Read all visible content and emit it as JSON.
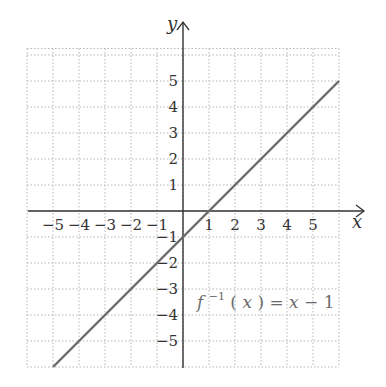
{
  "chart_data": {
    "type": "line",
    "title": "",
    "xlabel": "x",
    "ylabel": "y",
    "xlim": [
      -6,
      6
    ],
    "ylim": [
      -6,
      6.25
    ],
    "grid": true,
    "grid_style": "dotted",
    "x_ticks": [
      -5,
      -4,
      -3,
      -2,
      -1,
      1,
      2,
      3,
      4,
      5
    ],
    "y_ticks": [
      -5,
      -4,
      -3,
      -2,
      -1,
      1,
      2,
      3,
      4,
      5
    ],
    "x_tick_labels": [
      "−5",
      "−4",
      "−3",
      "−2",
      "−1",
      "1",
      "2",
      "3",
      "4",
      "5"
    ],
    "y_tick_labels": [
      "−5",
      "−4",
      "−3",
      "−2",
      "−1",
      "1",
      "2",
      "3",
      "4",
      "5"
    ],
    "series": [
      {
        "name": "f^-1(x) = x - 1",
        "equation": "y = x - 1",
        "color": "#6b6b6b",
        "x": [
          -5,
          6
        ],
        "y": [
          -6,
          5
        ]
      }
    ],
    "annotations": [
      {
        "text": "f⁻¹(x) = x − 1",
        "x": 1.1,
        "y": -3.4
      }
    ]
  },
  "labels": {
    "x_axis": "x",
    "y_axis": "y",
    "fn_f": "f",
    "fn_sup": "−1",
    "fn_rest_open": "(",
    "fn_x": "x",
    "fn_rest_mid": ") = ",
    "fn_x2": "x",
    "fn_tail": " − 1"
  }
}
